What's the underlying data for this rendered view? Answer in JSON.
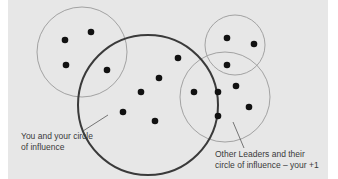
{
  "diagram": {
    "colors": {
      "background": "#e7e7e7",
      "thin_circle": "#9a9a9a",
      "thick_circle": "#3a3a3a",
      "dot": "#111111",
      "pointer": "#555555"
    },
    "circles": [
      {
        "id": "left-leader",
        "cx": 82,
        "cy": 52,
        "r": 45,
        "weight": "thin"
      },
      {
        "id": "top-right-leader",
        "cx": 235,
        "cy": 45,
        "r": 30,
        "weight": "thin"
      },
      {
        "id": "lower-right-leader",
        "cx": 225,
        "cy": 97,
        "r": 45,
        "weight": "thin"
      },
      {
        "id": "you",
        "cx": 148,
        "cy": 105,
        "r": 70,
        "weight": "thick"
      }
    ],
    "dots": [
      {
        "x": 65,
        "y": 40
      },
      {
        "x": 91,
        "y": 32
      },
      {
        "x": 66,
        "y": 65
      },
      {
        "x": 107,
        "y": 70
      },
      {
        "x": 178,
        "y": 58
      },
      {
        "x": 159,
        "y": 78
      },
      {
        "x": 141,
        "y": 92
      },
      {
        "x": 123,
        "y": 112
      },
      {
        "x": 155,
        "y": 121
      },
      {
        "x": 227,
        "y": 38
      },
      {
        "x": 254,
        "y": 44
      },
      {
        "x": 227,
        "y": 65
      },
      {
        "x": 194,
        "y": 92
      },
      {
        "x": 218,
        "y": 92
      },
      {
        "x": 236,
        "y": 86
      },
      {
        "x": 218,
        "y": 116
      },
      {
        "x": 249,
        "y": 107
      }
    ],
    "labels": {
      "you_line1": "You and your circle",
      "you_line2": "of influence",
      "others_line1": "Other Leaders and their",
      "others_line2": "circle of influence – your +1"
    }
  }
}
